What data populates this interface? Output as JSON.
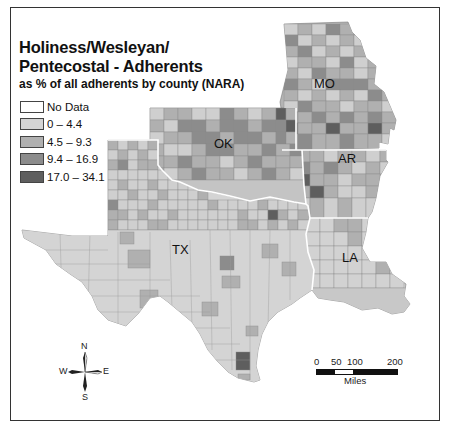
{
  "map": {
    "title_line1": "Holiness/Wesleyan/",
    "title_line2": "Pentecostal - Adherents",
    "subtitle": "as % of all adherents by county (NARA)",
    "legend": [
      {
        "label": "No Data",
        "color": "#ffffff"
      },
      {
        "label": "0 – 4.4",
        "color": "#d4d4d4"
      },
      {
        "label": "4.5 – 9.3",
        "color": "#b0b0b0"
      },
      {
        "label": "9.4 – 16.9",
        "color": "#8c8c8c"
      },
      {
        "label": "17.0 – 34.1",
        "color": "#5e5e5e"
      }
    ],
    "states": [
      {
        "abbr": "MO"
      },
      {
        "abbr": "OK"
      },
      {
        "abbr": "AR"
      },
      {
        "abbr": "TX"
      },
      {
        "abbr": "LA"
      }
    ],
    "compass": {
      "n": "N",
      "s": "S",
      "e": "E",
      "w": "W"
    },
    "scale": {
      "ticks": [
        "0",
        "50",
        "100",
        "200"
      ],
      "units": "Miles"
    }
  }
}
